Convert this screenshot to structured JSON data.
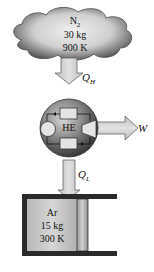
{
  "hot_reservoir": {
    "substance": "N",
    "subscript": "2",
    "mass": "30 kg",
    "temperature": "900 K"
  },
  "heat_in": {
    "symbol": "Q",
    "subscript": "H"
  },
  "engine": {
    "label": "HE"
  },
  "work_out": {
    "symbol": "W"
  },
  "heat_out": {
    "symbol": "Q",
    "subscript": "L"
  },
  "cold_reservoir": {
    "substance": "Ar",
    "mass": "15 kg",
    "temperature": "300 K"
  },
  "colors": {
    "cloud_dark": "#555555",
    "cloud_light": "#e6e6e6",
    "arrow_fill": "#cfcfcf",
    "cylinder_wall": "#2a2a2a",
    "gas_fill": "#c8c8c8"
  }
}
